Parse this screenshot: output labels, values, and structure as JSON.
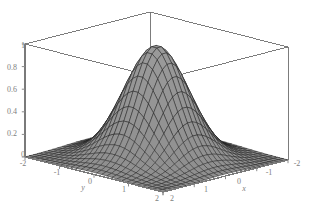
{
  "figure": {
    "kind": "surface-plot-3d",
    "background_color": "#ffffff",
    "box_line_color": "#6e6e6e",
    "axis_line_color": "#7a7a7a",
    "tick_color": "#8a8a8a",
    "label_color": "#808080",
    "surface_fill_color": "#9b9b9b",
    "surface_fill_color_dark": "#6a6a6a",
    "mesh_line_color": "#1a1a1a"
  },
  "chart_data": {
    "type": "surface",
    "title": "",
    "subtitle": "",
    "xlabel": "x",
    "ylabel": "y",
    "zlabel": "",
    "grid": false,
    "legend": false,
    "legend_position": "none",
    "function": "exp(-(x^2 + y^2))",
    "xlim": [
      -2,
      2
    ],
    "ylim": [
      -2,
      2
    ],
    "zlim": [
      0,
      1
    ],
    "x_ticks": [
      2,
      1,
      0,
      -1,
      -2
    ],
    "x_tick_labels": [
      "2",
      "1",
      "0",
      "-1",
      "-2"
    ],
    "y_ticks": [
      -2,
      -1,
      0,
      1,
      2
    ],
    "y_tick_labels": [
      "-2",
      "-1",
      "0",
      "1",
      "2"
    ],
    "z_ticks": [
      0,
      0.2,
      0.4,
      0.6,
      0.8,
      1
    ],
    "z_tick_labels": [
      "0",
      "0.2",
      "0.4",
      "0.6",
      "0.8",
      "1"
    ],
    "mesh_n": 27,
    "peak_value": 1,
    "peak_x": 0,
    "peak_y": 0,
    "view": {
      "azimuth_deg": 45,
      "elevation_deg": 24
    },
    "z_values_note": "z = exp(-(x^2+y^2)) sampled on a 27x27 grid over [-2,2]^2",
    "sample_profile_y0": {
      "x": [
        -2,
        -1.5,
        -1,
        -0.5,
        0,
        0.5,
        1,
        1.5,
        2
      ],
      "z": [
        0.018,
        0.105,
        0.368,
        0.779,
        1.0,
        0.779,
        0.368,
        0.105,
        0.018
      ]
    }
  },
  "labels": {
    "z": [
      {
        "text": "1",
        "x": 25,
        "y": 48
      },
      {
        "text": "0.8",
        "x": 17,
        "y": 70
      },
      {
        "text": "0.6",
        "x": 17,
        "y": 92
      },
      {
        "text": "0.4",
        "x": 17,
        "y": 114
      },
      {
        "text": "0.2",
        "x": 17,
        "y": 136
      },
      {
        "text": "0",
        "x": 25,
        "y": 157
      }
    ],
    "y_edge": [
      {
        "text": "-2",
        "x": 23,
        "y": 166
      },
      {
        "text": "-1",
        "x": 57,
        "y": 175
      },
      {
        "text": "0",
        "x": 90,
        "y": 184
      },
      {
        "text": "1",
        "x": 124,
        "y": 192
      },
      {
        "text": "2",
        "x": 157,
        "y": 201
      }
    ],
    "x_edge": [
      {
        "text": "2",
        "x": 172,
        "y": 201
      },
      {
        "text": "1",
        "x": 206,
        "y": 192
      },
      {
        "text": "0",
        "x": 239,
        "y": 184
      },
      {
        "text": "-1",
        "x": 269,
        "y": 175
      },
      {
        "text": "-2",
        "x": 297,
        "y": 166
      }
    ],
    "axis_names": [
      {
        "text": "y",
        "x": 83,
        "y": 190
      },
      {
        "text": "x",
        "x": 244,
        "y": 191
      }
    ]
  }
}
